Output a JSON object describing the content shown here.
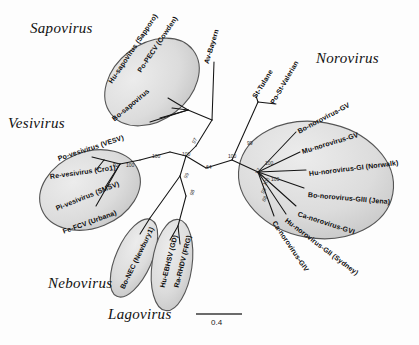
{
  "figure": {
    "type": "phylogenetic-tree",
    "title": "",
    "background_color": "#fdfdfd",
    "ellipse_fill": "#d9d9d9",
    "ellipse_stroke": "#4a4a4a",
    "branch_color": "#1a1a1a"
  },
  "genera": [
    {
      "name": "Sapovirus",
      "x": 30,
      "y": 28
    },
    {
      "name": "Vesivirus",
      "x": 8,
      "y": 123
    },
    {
      "name": "Norovirus",
      "x": 316,
      "y": 58
    },
    {
      "name": "Nebovirus",
      "x": 48,
      "y": 283
    },
    {
      "name": "Lagovirus",
      "x": 108,
      "y": 314
    }
  ],
  "clusters": [
    {
      "genus": "Sapovirus",
      "ellipse": {
        "cx": 152,
        "cy": 82,
        "rx": 52,
        "ry": 38,
        "rotate": -38
      },
      "taxa": [
        {
          "label": "Po-PECV (Cowden)",
          "x": 139,
          "y": 68,
          "rotate": -56
        },
        {
          "label": "Hu-sapovirus (Sapporo)",
          "x": 110,
          "y": 79,
          "rotate": -56
        },
        {
          "label": "Bo-sapovirus",
          "x": 113,
          "y": 116,
          "rotate": -40
        }
      ]
    },
    {
      "genus": "Vesivirus",
      "ellipse": {
        "cx": 90,
        "cy": 190,
        "rx": 52,
        "ry": 38,
        "rotate": -22
      },
      "taxa": [
        {
          "label": "Po-vesivirus (VESV)",
          "x": 58,
          "y": 155,
          "rotate": -18
        },
        {
          "label": "Re-vesivirus (Cro1)",
          "x": 50,
          "y": 173,
          "rotate": -8
        },
        {
          "label": "Pi-vesivirus (SMSV)",
          "x": 56,
          "y": 205,
          "rotate": -22
        },
        {
          "label": "Fe-FCV (Urbana)",
          "x": 63,
          "y": 228,
          "rotate": -20
        }
      ]
    },
    {
      "genus": "Norovirus",
      "ellipse": {
        "cx": 316,
        "cy": 180,
        "rx": 78,
        "ry": 58,
        "rotate": 10
      },
      "taxa": [
        {
          "label": "Bo-norovirus-GV",
          "x": 298,
          "y": 128,
          "rotate": -28
        },
        {
          "label": "Mu-norovirus-GV",
          "x": 302,
          "y": 148,
          "rotate": -17
        },
        {
          "label": "Hu-norovirus-GI (Norwalk)",
          "x": 309,
          "y": 170,
          "rotate": -7
        },
        {
          "label": "Bo-norovirus-GIII (Jena)",
          "x": 308,
          "y": 191,
          "rotate": 5
        },
        {
          "label": "Ca-norovirus-GVI",
          "x": 298,
          "y": 210,
          "rotate": 18
        },
        {
          "label": "Hu-norovirus-GII (Sydney)",
          "x": 286,
          "y": 216,
          "rotate": 37
        },
        {
          "label": "Ca-norovirus-GIV",
          "x": 274,
          "y": 218,
          "rotate": 56
        }
      ]
    },
    {
      "genus": "Nebovirus",
      "ellipse": {
        "cx": 134,
        "cy": 258,
        "rx": 18,
        "ry": 42,
        "rotate": 24
      },
      "taxa": [
        {
          "label": "Bo-NEC (Newbury1)",
          "x": 122,
          "y": 285,
          "rotate": -64
        }
      ]
    },
    {
      "genus": "Lagovirus",
      "ellipse": {
        "cx": 172,
        "cy": 265,
        "rx": 20,
        "ry": 46,
        "rotate": 8
      },
      "taxa": [
        {
          "label": "Hu-EBHSV (GD)",
          "x": 162,
          "y": 284,
          "rotate": -76
        },
        {
          "label": "Ra-RHDV (FRG)",
          "x": 176,
          "y": 284,
          "rotate": -76
        }
      ]
    }
  ],
  "outgroup_taxa": [
    {
      "label": "Av-Bayern",
      "x": 206,
      "y": 60,
      "rotate": -73
    },
    {
      "label": "St-Tulane",
      "x": 254,
      "y": 94,
      "rotate": -58
    },
    {
      "label": "Po-St-Valerian",
      "x": 272,
      "y": 100,
      "rotate": -60
    }
  ],
  "bootstrap_values": [
    {
      "value": "64",
      "x": 206,
      "y": 164
    },
    {
      "value": "100",
      "x": 228,
      "y": 153
    },
    {
      "value": "100",
      "x": 182,
      "y": 151
    },
    {
      "value": "97",
      "x": 193,
      "y": 140
    },
    {
      "value": "100",
      "x": 152,
      "y": 153
    },
    {
      "value": "100",
      "x": 126,
      "y": 162
    },
    {
      "value": "92",
      "x": 113,
      "y": 162
    },
    {
      "value": "99",
      "x": 185,
      "y": 175
    },
    {
      "value": "98",
      "x": 191,
      "y": 192
    },
    {
      "value": "99",
      "x": 247,
      "y": 140
    },
    {
      "value": "100",
      "x": 265,
      "y": 160
    },
    {
      "value": "97",
      "x": 265,
      "y": 172
    },
    {
      "value": "100",
      "x": 271,
      "y": 176
    },
    {
      "value": "100",
      "x": 264,
      "y": 182
    },
    {
      "value": "98",
      "x": 262,
      "y": 190
    },
    {
      "value": "88",
      "x": 263,
      "y": 197
    }
  ],
  "scale_bar": {
    "label": "0.4",
    "x": 196,
    "y": 314,
    "length": 46
  }
}
